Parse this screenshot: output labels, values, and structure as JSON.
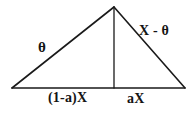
{
  "figure": {
    "background_color": "#ffffff",
    "stroke_color": "#1a1a1a",
    "title": "",
    "geometry": {
      "apex": {
        "x": 114,
        "y": 7
      },
      "base_left_vertex": {
        "x": 12,
        "y": 88
      },
      "base_right_vertex": {
        "x": 185,
        "y": 88
      },
      "altitude_foot": {
        "x": 114,
        "y": 88
      }
    },
    "labels": {
      "left_slope": "θ",
      "right_slope": "X - θ",
      "base_left_segment": "(1-a)X",
      "base_right_segment": "aX"
    }
  }
}
